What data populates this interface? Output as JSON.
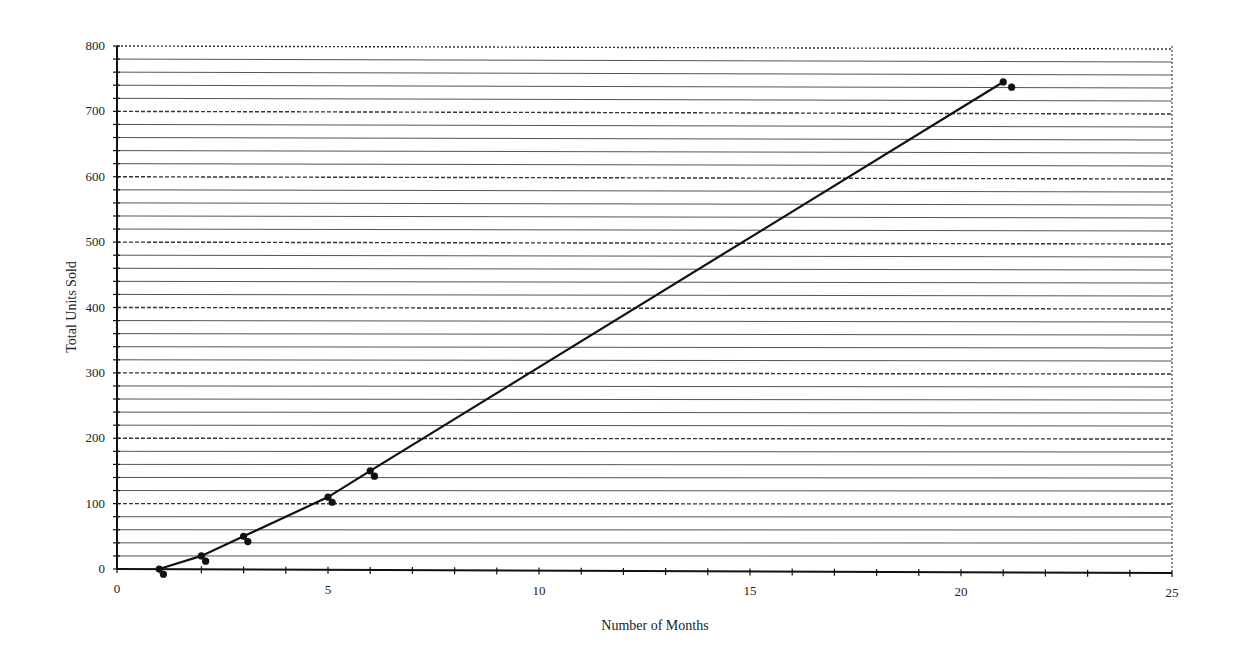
{
  "chart_data": {
    "type": "line",
    "title": "",
    "xlabel": "Number of Months",
    "ylabel": "Total Units Sold",
    "xlim": [
      0,
      25
    ],
    "ylim": [
      0,
      800
    ],
    "x_ticks": [
      0,
      5,
      10,
      15,
      20,
      25
    ],
    "y_ticks": [
      0,
      100,
      200,
      300,
      400,
      500,
      600,
      700,
      800
    ],
    "x_minor_step": 1,
    "y_minor_step": 20,
    "grid": {
      "horizontal_major": "dashed every 100",
      "horizontal_minor": "solid every 20",
      "vertical": false
    },
    "legend": null,
    "series": [
      {
        "name": "Total Units Sold",
        "marker": "circle",
        "line": true,
        "x": [
          1,
          2,
          3,
          5,
          6,
          21
        ],
        "y": [
          0,
          20,
          50,
          110,
          150,
          745
        ]
      },
      {
        "name": "Offset markers",
        "marker": "circle",
        "line": false,
        "x": [
          1.1,
          2.1,
          3.1,
          5.1,
          6.1,
          21.2
        ],
        "y": [
          -8,
          12,
          42,
          102,
          142,
          737
        ]
      }
    ]
  },
  "colors": {
    "line": "#111111",
    "grid_minor": "#555555",
    "grid_major": "#333333",
    "background": "#ffffff"
  }
}
